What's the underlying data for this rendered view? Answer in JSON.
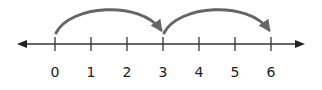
{
  "diagram": {
    "type": "number-line",
    "line": {
      "x_start": 17,
      "x_end": 304,
      "y": 44,
      "color": "#333333",
      "arrows": "both"
    },
    "ticks": [
      {
        "value": "0",
        "x": 55
      },
      {
        "value": "1",
        "x": 91
      },
      {
        "value": "2",
        "x": 127
      },
      {
        "value": "3",
        "x": 163
      },
      {
        "value": "4",
        "x": 199
      },
      {
        "value": "5",
        "x": 235
      },
      {
        "value": "6",
        "x": 271
      }
    ],
    "jumps": [
      {
        "from": "0",
        "to": "3",
        "size": 3
      },
      {
        "from": "3",
        "to": "6",
        "size": 3
      }
    ],
    "jump_color": "#666666",
    "label_color": "#222222"
  }
}
